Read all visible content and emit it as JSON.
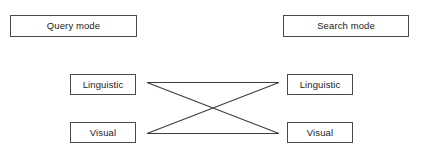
{
  "diagram": {
    "width": 422,
    "height": 158,
    "background_color": "#ffffff",
    "box_border_color": "#4a4a4a",
    "line_color": "#3c3c3c",
    "text_color": "#1a1a1a"
  },
  "columns": {
    "left": {
      "header": "Query mode",
      "nodes": [
        {
          "label": "Linguistic"
        },
        {
          "label": "Visual"
        }
      ]
    },
    "right": {
      "header": "Search mode",
      "nodes": [
        {
          "label": "Linguistic"
        },
        {
          "label": "Visual"
        }
      ]
    }
  },
  "connections": [
    {
      "from": "left-linguistic",
      "to": "right-linguistic",
      "kind": "horizontal-top"
    },
    {
      "from": "left-visual",
      "to": "right-visual",
      "kind": "horizontal-bottom"
    },
    {
      "from": "left-linguistic",
      "to": "right-visual",
      "kind": "diagonal-descending"
    },
    {
      "from": "left-visual",
      "to": "right-linguistic",
      "kind": "diagonal-ascending"
    }
  ]
}
